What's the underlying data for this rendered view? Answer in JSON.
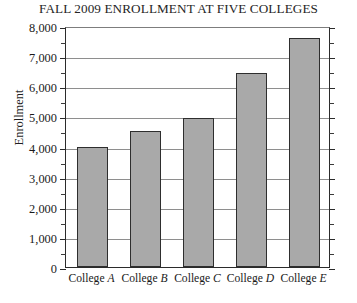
{
  "chart_data": {
    "type": "bar",
    "title": "FALL 2009 ENROLLMENT AT FIVE COLLEGES",
    "xlabel": "",
    "ylabel": "Enrollment",
    "categories": [
      "College A",
      "College B",
      "College C",
      "College D",
      "College E"
    ],
    "category_prefix": "College",
    "category_letters": [
      "A",
      "B",
      "C",
      "D",
      "E"
    ],
    "values": [
      4000,
      4500,
      4950,
      6450,
      7600
    ],
    "ylim": [
      0,
      8000
    ],
    "ytick_step": 1000,
    "yminor_step": 500,
    "ytick_labels": [
      "0",
      "1,000",
      "2,000",
      "3,000",
      "4,000",
      "5,000",
      "6,000",
      "7,000",
      "8,000"
    ],
    "ytick_values": [
      0,
      1000,
      2000,
      3000,
      4000,
      5000,
      6000,
      7000,
      8000
    ],
    "grid": true,
    "legend": false,
    "bar_color": "#a9a9a9",
    "bar_edge_color": "#2e2e2e",
    "grid_color": "#8e8e8e",
    "axis_color": "#2b2b2b",
    "background": "#ffffff"
  }
}
